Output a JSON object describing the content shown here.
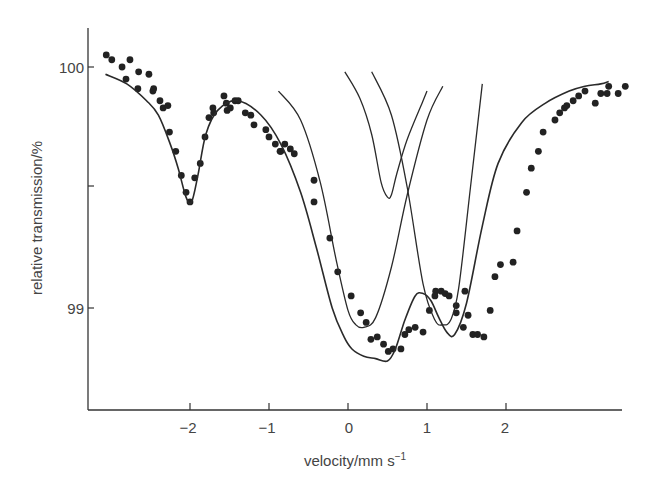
{
  "chart_data": {
    "type": "scatter",
    "title": "",
    "xlabel": "velocity/mm s",
    "xlabel_superscript": "−1",
    "ylabel": "relative transmission/%",
    "xlim": [
      -3.3,
      3.45
    ],
    "ylim": [
      98.37,
      100.16
    ],
    "x_ticks": [
      -2,
      -1,
      0,
      1,
      2
    ],
    "x_tick_labels": [
      "−2",
      "−1",
      "0",
      "1",
      "2"
    ],
    "y_ticks": [
      99,
      99.5,
      100
    ],
    "y_tick_labels": [
      "99",
      "",
      "100"
    ],
    "grid": false,
    "legend": null,
    "series": [
      {
        "name": "measured spectrum",
        "kind": "points",
        "x": [
          -3.06,
          -2.99,
          -2.86,
          -2.81,
          -2.76,
          -2.66,
          -2.65,
          -2.52,
          -2.47,
          -2.46,
          -2.38,
          -2.34,
          -2.28,
          -2.26,
          -2.18,
          -2.11,
          -2.05,
          -2.0,
          -1.94,
          -1.87,
          -1.81,
          -1.76,
          -1.71,
          -1.7,
          -1.54,
          -1.53,
          -1.49,
          -1.57,
          -1.43,
          -1.39,
          -1.3,
          -1.23,
          -1.19,
          -1.04,
          -1.0,
          -0.92,
          -0.86,
          -0.85,
          -0.8,
          -0.73,
          -0.68,
          -0.43,
          -0.43,
          -0.23,
          -0.13,
          0.04,
          0.16,
          0.23,
          0.29,
          0.37,
          0.51,
          0.45,
          0.57,
          0.67,
          0.72,
          0.77,
          0.85,
          0.95,
          1.03,
          1.11,
          1.1,
          1.18,
          1.23,
          1.28,
          1.37,
          1.37,
          1.46,
          1.48,
          1.52,
          1.58,
          1.64,
          1.72,
          1.8,
          1.86,
          1.93,
          2.09,
          2.14,
          2.26,
          2.32,
          2.41,
          2.47,
          2.62,
          2.68,
          2.74,
          2.77,
          2.85,
          2.92,
          3.0,
          3.13,
          3.2,
          3.28,
          3.3,
          3.42,
          3.51
        ],
        "y": [
          100.05,
          100.03,
          100.0,
          99.95,
          100.03,
          99.91,
          99.98,
          99.97,
          99.9,
          99.91,
          99.86,
          99.83,
          99.84,
          99.73,
          99.65,
          99.55,
          99.48,
          99.44,
          99.54,
          99.6,
          99.71,
          99.79,
          99.83,
          99.81,
          99.85,
          99.82,
          99.83,
          99.88,
          99.86,
          99.86,
          99.81,
          99.8,
          99.76,
          99.74,
          99.71,
          99.68,
          99.65,
          99.65,
          99.68,
          99.66,
          99.64,
          99.44,
          99.53,
          99.29,
          99.15,
          99.05,
          98.98,
          98.94,
          98.87,
          98.88,
          98.82,
          98.85,
          98.83,
          98.83,
          98.89,
          98.91,
          98.92,
          98.9,
          98.99,
          99.07,
          99.05,
          99.07,
          99.06,
          99.05,
          99.01,
          98.98,
          98.92,
          99.07,
          98.97,
          98.89,
          98.89,
          98.88,
          98.99,
          99.13,
          99.18,
          99.19,
          99.32,
          99.48,
          99.58,
          99.65,
          99.73,
          99.78,
          99.81,
          99.83,
          99.84,
          99.86,
          99.88,
          99.9,
          99.85,
          99.89,
          99.89,
          99.92,
          99.89,
          99.92
        ]
      },
      {
        "name": "total fit",
        "kind": "line",
        "x": [
          -3.07,
          -2.8,
          -2.55,
          -2.4,
          -2.25,
          -2.15,
          -2.05,
          -1.98,
          -1.9,
          -1.8,
          -1.65,
          -1.4,
          -1.1,
          -0.85,
          -0.6,
          -0.4,
          -0.2,
          -0.05,
          0.05,
          0.2,
          0.35,
          0.5,
          0.6,
          0.72,
          0.85,
          0.95,
          1.05,
          1.15,
          1.25,
          1.35,
          1.5,
          1.7,
          1.9,
          2.2,
          2.5,
          2.8,
          3.0,
          3.2,
          3.3
        ],
        "y": [
          99.97,
          99.93,
          99.86,
          99.8,
          99.68,
          99.58,
          99.46,
          99.44,
          99.55,
          99.72,
          99.82,
          99.86,
          99.8,
          99.68,
          99.48,
          99.25,
          99.0,
          98.88,
          98.83,
          98.8,
          98.79,
          98.78,
          98.83,
          98.95,
          99.05,
          99.06,
          99.03,
          98.96,
          98.9,
          98.89,
          99.02,
          99.34,
          99.6,
          99.77,
          99.85,
          99.9,
          99.92,
          99.93,
          99.94
        ]
      },
      {
        "name": "component left line",
        "kind": "line",
        "x": [
          -0.88,
          -0.6,
          -0.35,
          -0.15,
          0.0,
          0.1,
          0.2,
          0.35,
          0.55,
          0.75,
          1.0,
          1.2
        ],
        "y": [
          99.9,
          99.78,
          99.52,
          99.2,
          98.99,
          98.93,
          98.92,
          98.96,
          99.17,
          99.47,
          99.78,
          99.92
        ]
      },
      {
        "name": "component right line",
        "kind": "line",
        "x": [
          0.3,
          0.55,
          0.75,
          0.95,
          1.1,
          1.2,
          1.3,
          1.4,
          1.55,
          1.7
        ],
        "y": [
          99.98,
          99.8,
          99.5,
          99.1,
          98.95,
          98.93,
          98.95,
          99.08,
          99.5,
          99.93
        ]
      },
      {
        "name": "component central sharp line",
        "kind": "line",
        "x": [
          -0.04,
          0.15,
          0.3,
          0.42,
          0.5,
          0.55,
          0.62,
          0.75,
          0.95,
          1.0
        ],
        "y": [
          99.98,
          99.87,
          99.72,
          99.52,
          99.46,
          99.47,
          99.56,
          99.7,
          99.86,
          99.9
        ]
      }
    ]
  },
  "axes": {
    "y_tick_100": "100",
    "y_tick_99": "99",
    "x_tick_m2": "−2",
    "x_tick_m1": "−1",
    "x_tick_0": "0",
    "x_tick_1": "1",
    "x_tick_2": "2",
    "xlabel": "velocity/mm s",
    "xlabel_sup": "−1",
    "ylabel": "relative transmission/%"
  }
}
